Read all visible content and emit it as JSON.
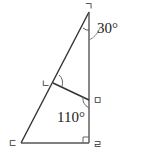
{
  "diagram": {
    "type": "geometry",
    "points": {
      "top": {
        "label": "ㄱ",
        "x": 89,
        "y": 10
      },
      "mid_left": {
        "label": "ㄴ",
        "x": 53,
        "y": 85
      },
      "bottom_left": {
        "label": "ㄷ",
        "x": 21,
        "y": 143
      },
      "bottom_right": {
        "label": "ㄹ",
        "x": 89,
        "y": 143
      },
      "mid_right": {
        "label": "ㅁ",
        "x": 89,
        "y": 100
      }
    },
    "angles": {
      "top_angle": "30°",
      "mid_right_angle": "110°"
    },
    "line_color": "#333333"
  }
}
